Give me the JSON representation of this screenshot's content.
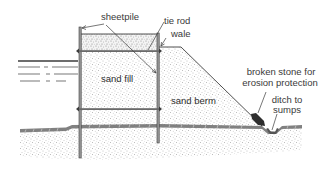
{
  "diagram": {
    "type": "cross-section",
    "labels": {
      "sheetpile": "sheetpile",
      "tie_rod": "tie rod",
      "wale": "wale",
      "sand_fill": "sand fill",
      "sand_berm": "sand berm",
      "broken_stone_line1": "broken stone for",
      "broken_stone_line2": "erosion protection",
      "ditch_line1": "ditch to",
      "ditch_line2": "sumps"
    },
    "colors": {
      "line": "#3c3c3c",
      "fill_stipple": "#8a8a8a",
      "ground_band": "#6b6b6b",
      "stone": "#2e2e2e",
      "text": "#3a3a3a",
      "background": "#ffffff"
    }
  }
}
